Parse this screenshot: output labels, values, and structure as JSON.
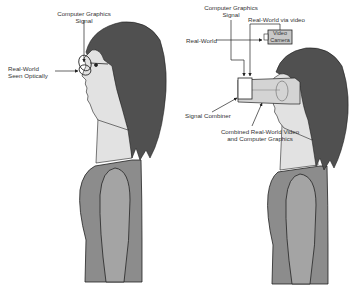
{
  "figures": {
    "optical": {
      "labels": {
        "cg_signal_line1": "Computer Graphics",
        "cg_signal_line2": "Signal",
        "real_world_line1": "Real-World",
        "real_world_line2": "Seen Optically"
      }
    },
    "video": {
      "labels": {
        "cg_signal_line1": "Computer Graphics",
        "cg_signal_line2": "Signal",
        "real_world_via_video": "Real-World via video",
        "real_world": "Real-World",
        "video_camera_line1": "Video",
        "video_camera_line2": "Camera",
        "signal_combiner": "Signal Combiner",
        "combined_line1": "Combined Real-World Video",
        "combined_line2": "and Computer Graphics"
      }
    }
  },
  "colors": {
    "hair": "#505050",
    "skin": "#e2e2e2",
    "shirt": "#8c8c8c",
    "sleeve": "#a4a4a4",
    "line": "#222222",
    "camera": "#c8c8c8"
  }
}
